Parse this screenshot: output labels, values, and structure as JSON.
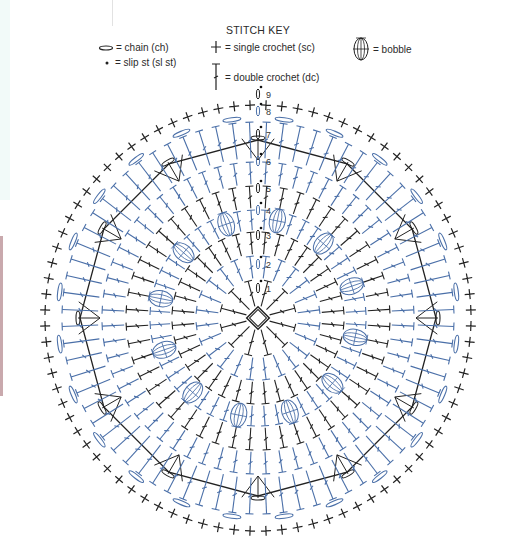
{
  "title": "STITCH KEY",
  "key": [
    {
      "id": "chain",
      "icon": "chain-oval-icon",
      "label": "= chain (ch)"
    },
    {
      "id": "slip",
      "icon": "slip-stitch-dot-icon",
      "label": "= slip st (sl st)"
    },
    {
      "id": "sc",
      "icon": "single-crochet-cross-icon",
      "label": "= single crochet (sc)"
    },
    {
      "id": "dc",
      "icon": "double-crochet-icon",
      "label": "= double crochet (dc)"
    },
    {
      "id": "bobble",
      "icon": "bobble-icon",
      "label": "= bobble"
    }
  ],
  "colors": {
    "black_rounds": "#222222",
    "blue_rounds": "#4a6fa8",
    "text": "#2a2a2a"
  },
  "diagram": {
    "type": "crochet-round-chart",
    "round_labels": [
      "1",
      "2",
      "3",
      "4",
      "5",
      "6",
      "7",
      "8",
      "9"
    ],
    "rounds": [
      {
        "round": 1,
        "color": "black",
        "stitch": "dc"
      },
      {
        "round": 2,
        "color": "blue",
        "stitch": "dc"
      },
      {
        "round": 3,
        "color": "black",
        "stitch": "dc"
      },
      {
        "round": 4,
        "color": "blue",
        "stitch": "dc + bobble"
      },
      {
        "round": 5,
        "color": "black",
        "stitch": "dc"
      },
      {
        "round": 6,
        "color": "blue",
        "stitch": "dc"
      },
      {
        "round": 7,
        "color": "black",
        "stitch": "dc clusters + ch"
      },
      {
        "round": 8,
        "color": "blue",
        "stitch": "dc + ch"
      },
      {
        "round": 9,
        "color": "black",
        "stitch": "sc"
      }
    ],
    "bobble_count": 12
  }
}
